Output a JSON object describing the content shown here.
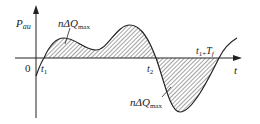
{
  "diagram": {
    "y_axis_label": {
      "main": "P",
      "sub": "au"
    },
    "x_axis_label": "t",
    "origin_label": "0",
    "t1_label": {
      "main": "t",
      "sub": "1"
    },
    "t2_label": {
      "main": "t",
      "sub": "2"
    },
    "t1_tf_label": {
      "t": "t",
      "sub1": "1+",
      "T": "T",
      "subf": "f"
    },
    "area_label_top": {
      "n": "nΔQ",
      "sub": "max"
    },
    "area_label_bottom": {
      "n": "nΔQ",
      "sub": "max"
    },
    "colors": {
      "line": "#222222",
      "hatch": "#333333",
      "background": "#ffffff"
    }
  }
}
